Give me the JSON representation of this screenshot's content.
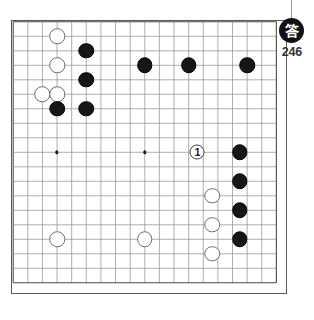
{
  "board": {
    "size": 19,
    "left": 11,
    "top": 20,
    "width": 276,
    "height": 274,
    "origin_x": 13.2,
    "origin_y": 21.8,
    "step_x": 14.62,
    "step_y": 14.5,
    "line_color": "#8d8d8d",
    "border_color": "#5a5a5a",
    "background": "#ffffff",
    "hoshi": [
      {
        "col": 3,
        "row": 3
      },
      {
        "col": 9,
        "row": 3
      },
      {
        "col": 3,
        "row": 9
      },
      {
        "col": 9,
        "row": 9
      }
    ],
    "stones": [
      {
        "color": "white",
        "col": 3,
        "row": 1,
        "label": ""
      },
      {
        "color": "black",
        "col": 5,
        "row": 2,
        "label": ""
      },
      {
        "color": "white",
        "col": 3,
        "row": 3,
        "label": ""
      },
      {
        "color": "black",
        "col": 9,
        "row": 3,
        "label": ""
      },
      {
        "color": "black",
        "col": 12,
        "row": 3,
        "label": ""
      },
      {
        "color": "black",
        "col": 16,
        "row": 3,
        "label": ""
      },
      {
        "color": "black",
        "col": 5,
        "row": 4,
        "label": ""
      },
      {
        "color": "white",
        "col": 2,
        "row": 5,
        "label": ""
      },
      {
        "color": "white",
        "col": 3,
        "row": 5,
        "label": ""
      },
      {
        "color": "black",
        "col": 3,
        "row": 6,
        "label": ""
      },
      {
        "color": "black",
        "col": 5,
        "row": 6,
        "label": ""
      },
      {
        "color": "marked",
        "col": 12.6,
        "row": 9,
        "label": "1"
      },
      {
        "color": "black",
        "col": 15.5,
        "row": 9,
        "label": ""
      },
      {
        "color": "black",
        "col": 15.5,
        "row": 11,
        "label": ""
      },
      {
        "color": "white",
        "col": 13.6,
        "row": 12,
        "label": ""
      },
      {
        "color": "black",
        "col": 15.5,
        "row": 13,
        "label": ""
      },
      {
        "color": "white",
        "col": 13.6,
        "row": 14,
        "label": ""
      },
      {
        "color": "white",
        "col": 3,
        "row": 15,
        "label": ""
      },
      {
        "color": "white",
        "col": 9,
        "row": 15,
        "label": ""
      },
      {
        "color": "black",
        "col": 15.5,
        "row": 15,
        "label": ""
      },
      {
        "color": "white",
        "col": 13.6,
        "row": 16,
        "label": ""
      }
    ],
    "stone_diameter": 15.5,
    "marked_stone_diameter": 15
  },
  "badge": {
    "glyph": "答",
    "glyph_meaning": "answer-kanji",
    "number": "246",
    "circle_color": "#111111",
    "text_color": "#ffffff"
  }
}
